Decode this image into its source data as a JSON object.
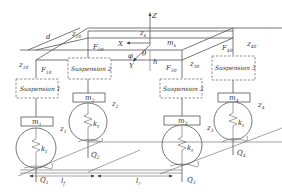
{
  "diagram": {
    "type": "full-vehicle suspension model",
    "body": {
      "mass_label": "m",
      "mass_sub": "s",
      "heave_label": "z",
      "heave_sub": "s"
    },
    "axes": {
      "z": "Z",
      "x": "X",
      "y": "Y",
      "pitch": "θ",
      "roll": "φ",
      "height": "h"
    },
    "dimensions": {
      "track_width": "d",
      "front": "l",
      "front_sub": "f",
      "rear": "l",
      "rear_sub": "r"
    },
    "suspensions": [
      {
        "label": "Suspension 1",
        "unsprung": "m",
        "unsprung_sub": "1",
        "z": "z",
        "z_sub": "1",
        "k": "k",
        "k_sub": "t",
        "Q": "Q",
        "Q_sub": "1",
        "F": "F",
        "F_sub": "10",
        "zc": "z",
        "zc_sub": "10"
      },
      {
        "label": "Suspension 2",
        "unsprung": "m",
        "unsprung_sub": "2",
        "z": "z",
        "z_sub": "2",
        "k": "k",
        "k_sub": "t",
        "Q": "Q",
        "Q_sub": "2",
        "F": "F",
        "F_sub": "20",
        "zc": "z",
        "zc_sub": "20"
      },
      {
        "label": "Suspension 3",
        "unsprung": "m",
        "unsprung_sub": "3",
        "z": "z",
        "z_sub": "3",
        "k": "k",
        "k_sub": "t",
        "Q": "Q",
        "Q_sub": "3",
        "F": "F",
        "F_sub": "30",
        "zc": "z",
        "zc_sub": "30"
      },
      {
        "label": "Suspension 3",
        "unsprung": "m",
        "unsprung_sub": "4",
        "z": "z",
        "z_sub": "4",
        "k": "k",
        "k_sub": "t",
        "Q": "Q",
        "Q_sub": "4",
        "F": "F",
        "F_sub": "40",
        "zc": "z",
        "zc_sub": "40"
      }
    ]
  }
}
